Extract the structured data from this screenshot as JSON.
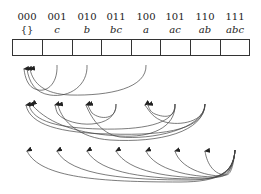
{
  "diagram": {
    "columns": [
      {
        "binary": "000",
        "subset": "{}"
      },
      {
        "binary": "001",
        "subset": "c"
      },
      {
        "binary": "010",
        "subset": "b"
      },
      {
        "binary": "011",
        "subset": "bc"
      },
      {
        "binary": "100",
        "subset": "a"
      },
      {
        "binary": "101",
        "subset": "ac"
      },
      {
        "binary": "110",
        "subset": "ab"
      },
      {
        "binary": "111",
        "subset": "abc"
      }
    ],
    "levels": [
      {
        "name": "singletons-to-empty",
        "edges": [
          [
            1,
            0
          ],
          [
            2,
            0
          ],
          [
            4,
            0
          ]
        ]
      },
      {
        "name": "pairs-to-subsets",
        "edges": [
          [
            3,
            1
          ],
          [
            3,
            2
          ],
          [
            5,
            1
          ],
          [
            5,
            4
          ],
          [
            6,
            2
          ],
          [
            6,
            4
          ]
        ]
      },
      {
        "name": "full-set-to-others",
        "edges": [
          [
            7,
            0
          ],
          [
            7,
            1
          ],
          [
            7,
            2
          ],
          [
            7,
            3
          ],
          [
            7,
            4
          ],
          [
            7,
            5
          ],
          [
            7,
            6
          ]
        ]
      }
    ],
    "stroke_color": "#333333"
  }
}
